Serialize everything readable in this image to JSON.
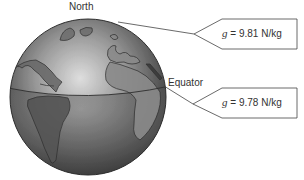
{
  "diagram": {
    "labels": {
      "north": "North",
      "equator": "Equator"
    },
    "callouts": [
      {
        "symbol": "g",
        "equals": "=",
        "value": "9.81",
        "unit": "N/kg",
        "location": "North"
      },
      {
        "symbol": "g",
        "equals": "=",
        "value": "9.78",
        "unit": "N/kg",
        "location": "Equator"
      }
    ],
    "colors": {
      "globe_light": "#d8d8d8",
      "globe_dark": "#3a3a3a",
      "outline": "#333333",
      "callout_stroke": "#444444",
      "background": "#ffffff"
    }
  }
}
